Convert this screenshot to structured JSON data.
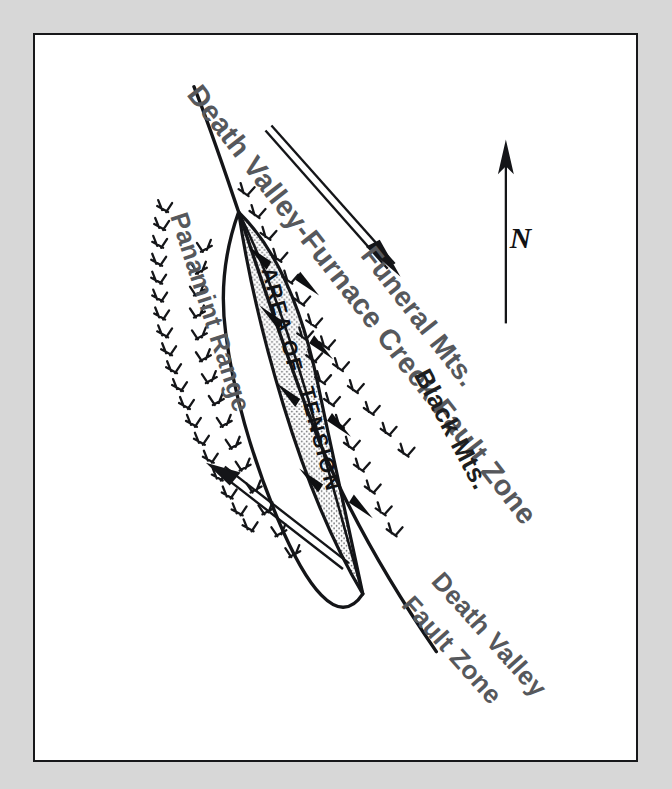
{
  "figure": {
    "kind": "geologic-sketch-map",
    "region": "Death Valley, California",
    "background_color": "#d7d7d7",
    "paper_color": "#ffffff",
    "border_color": "#17181a",
    "label_color": "#56585c",
    "ink_color": "#141518"
  },
  "labels": {
    "main_fault_zone": "Death Valley-Furnace Creek Fault Zone",
    "panamint_range": "Panamint Range",
    "funeral_mts": "Funeral Mts.",
    "black_mts": "Black Mts.",
    "death_valley_fault_line1": "Death Valley",
    "death_valley_fault_line2": "Fault Zone",
    "area_of_tension_line1": "AREA  OF",
    "area_of_tension_line2": "TENSION"
  },
  "north_arrow": {
    "letter": "N",
    "direction": "up",
    "name": "north-arrow"
  },
  "shear_arrows": [
    {
      "name": "upper-shear-arrow",
      "sense": "right-lateral",
      "points_toward": "southeast"
    },
    {
      "name": "lower-shear-arrow",
      "sense": "right-lateral",
      "points_toward": "northwest"
    }
  ],
  "tension_arrows": {
    "count": 8,
    "description": "paired divergent arrows indicating extension across the pull-apart basin"
  },
  "map_features": [
    {
      "name": "death-valley-furnace-creek-fault-zone",
      "type": "strike-slip-fault"
    },
    {
      "name": "death-valley-fault-zone",
      "type": "strike-slip-fault"
    },
    {
      "name": "panamint-range",
      "type": "mountain-range"
    },
    {
      "name": "funeral-mountains",
      "type": "mountain-range"
    },
    {
      "name": "black-mountains",
      "type": "mountain-range"
    },
    {
      "name": "area-of-tension",
      "type": "pull-apart-basin"
    }
  ]
}
